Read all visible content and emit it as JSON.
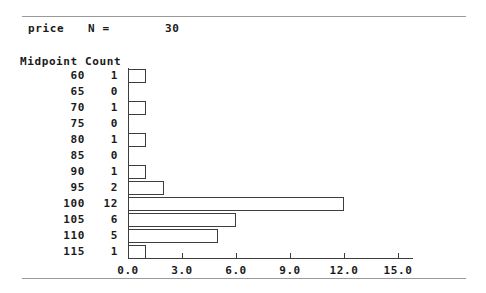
{
  "header": {
    "variable": "price",
    "n_label": "N =",
    "n_value": "30"
  },
  "table": {
    "midpoint_header": "Midpoint",
    "count_header": "Count"
  },
  "chart_data": {
    "type": "bar",
    "orientation": "horizontal",
    "title": "price",
    "xlabel": "",
    "ylabel": "Midpoint",
    "categories": [
      "60",
      "65",
      "70",
      "75",
      "80",
      "85",
      "90",
      "95",
      "100",
      "105",
      "110",
      "115"
    ],
    "values": [
      1,
      0,
      1,
      0,
      1,
      0,
      1,
      2,
      12,
      6,
      5,
      1
    ],
    "xlim": [
      0,
      15.8
    ],
    "xticks": [
      0,
      3,
      6,
      9,
      12,
      15
    ],
    "xtick_labels": [
      "0.0",
      "3.0",
      "6.0",
      "9.0",
      "12.0",
      "15.0"
    ],
    "grid": false,
    "legend": false,
    "bar_fill": "#ffffff",
    "bar_stroke": "#3d3d3d",
    "n": 30
  },
  "style": {
    "background": "#ffffff",
    "text_color": "#1a1a1a",
    "rule_color": "#9a9a9a"
  }
}
